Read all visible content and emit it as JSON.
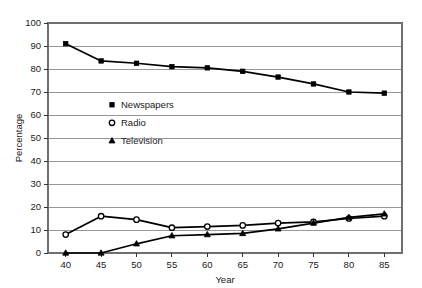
{
  "chart_data": {
    "type": "line",
    "title": "",
    "subtitle": "",
    "xlabel": "Year",
    "ylabel": "Percentage",
    "x": [
      40,
      45,
      50,
      55,
      60,
      65,
      70,
      75,
      80,
      85
    ],
    "xtick_labels": [
      "40",
      "45",
      "50",
      "55",
      "60",
      "65",
      "70",
      "75",
      "80",
      "85"
    ],
    "ytick_labels": [
      "0",
      "10",
      "20",
      "30",
      "40",
      "50",
      "60",
      "70",
      "80",
      "90",
      "100"
    ],
    "xlim": [
      37.5,
      87.5
    ],
    "ylim": [
      0,
      100
    ],
    "grid": "horizontal",
    "legend_position": "inside-upper-left",
    "series": [
      {
        "name": "Newspapers",
        "marker": "filled-square",
        "values": [
          91,
          83.5,
          82.5,
          81,
          80.5,
          79,
          76.5,
          73.5,
          70,
          69.5
        ]
      },
      {
        "name": "Radio",
        "marker": "open-circle",
        "values": [
          8,
          16,
          14.5,
          11,
          11.5,
          12,
          13,
          13.5,
          15,
          16
        ]
      },
      {
        "name": "Television",
        "marker": "filled-triangle",
        "values": [
          0,
          0,
          4,
          7.5,
          8,
          8.5,
          10.5,
          13,
          15.5,
          17
        ]
      }
    ]
  },
  "axes": {
    "y_title": "Percentage",
    "x_title": "Year"
  },
  "legend": {
    "entries": [
      {
        "label": "Newspapers",
        "marker": "filled-square"
      },
      {
        "label": "Radio",
        "marker": "open-circle"
      },
      {
        "label": "Television",
        "marker": "filled-triangle"
      }
    ]
  }
}
